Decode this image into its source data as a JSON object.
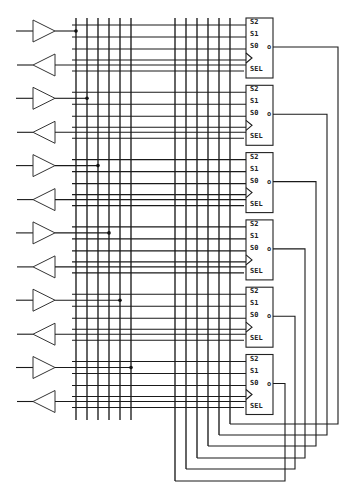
{
  "diagram": {
    "title": "",
    "stage_count": 6,
    "bus_lines_per_group": 6,
    "register": {
      "pins": [
        "S2",
        "S1",
        "S0",
        "SEL"
      ],
      "output_bubble": "o"
    },
    "components": [
      {
        "type": "buffer",
        "direction": "right"
      },
      {
        "type": "inverter-buffer",
        "direction": "left"
      },
      {
        "type": "mux-register"
      },
      {
        "type": "junction-dot"
      },
      {
        "type": "clock-input"
      }
    ],
    "colors": {
      "line": "#1a1a1a",
      "background": "#ffffff"
    }
  }
}
